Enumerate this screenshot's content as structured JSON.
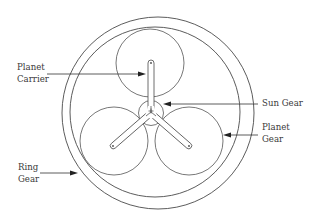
{
  "diagram": {
    "colors": {
      "line": "#4a4a4a",
      "text": "#3a3a3a",
      "background": "#ffffff"
    },
    "labels": {
      "planet_carrier": {
        "line1": "Planet",
        "line2": "Carrier"
      },
      "sun_gear": {
        "line1": "Sun Gear"
      },
      "planet_gear": {
        "line1": "Planet",
        "line2": "Gear"
      },
      "ring_gear": {
        "line1": "Ring",
        "line2": "Gear"
      }
    },
    "components": [
      {
        "name": "Ring Gear",
        "shape": "annulus"
      },
      {
        "name": "Planet Gear",
        "count": 3,
        "shape": "circle"
      },
      {
        "name": "Sun Gear",
        "shape": "circle"
      },
      {
        "name": "Planet Carrier",
        "shape": "three-arm spider"
      }
    ]
  }
}
